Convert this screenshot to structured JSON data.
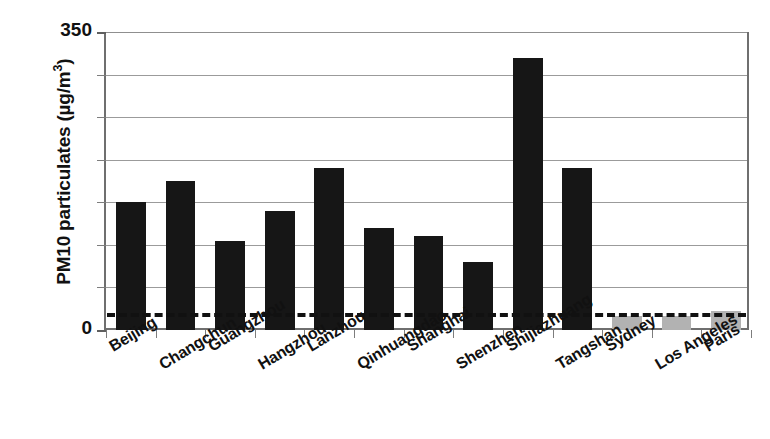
{
  "chart_data": {
    "type": "bar",
    "title": "",
    "subtitle": "",
    "xlabel": "",
    "ylabel": "PM10 particulates (µg/m³)",
    "ylabel_parts": {
      "prefix": "PM10 particulates (µg/m",
      "sup": "3",
      "suffix": ")"
    },
    "ylim": [
      0,
      350
    ],
    "ytick_values": [
      0,
      50,
      100,
      150,
      200,
      250,
      300,
      350
    ],
    "ytick_labels_shown": [
      "350",
      "0"
    ],
    "ymax_label": "350",
    "ymin_label": "0",
    "grid": true,
    "grid_axis": "y",
    "legend": "none",
    "categories": [
      "Beijing",
      "Changchun",
      "Guangzhou",
      "Hangzhou",
      "Lanzhou",
      "Qinhuangdao",
      "Shanghai",
      "Shenzhen",
      "Shijiazhuang",
      "Tangshan",
      "Sydney",
      "Los Angeles",
      "Paris"
    ],
    "values": [
      150,
      175,
      105,
      140,
      190,
      120,
      110,
      80,
      320,
      190,
      17,
      17,
      22
    ],
    "bar_colors": [
      "#161616",
      "#161616",
      "#161616",
      "#161616",
      "#161616",
      "#161616",
      "#161616",
      "#161616",
      "#161616",
      "#161616",
      "#b2b2b2",
      "#b2b2b2",
      "#b2b2b2"
    ],
    "reference_line": {
      "value": 20,
      "style": "dashed",
      "color": "#111111",
      "label": ""
    },
    "colors": {
      "bar_dark": "#161616",
      "bar_light": "#b2b2b2",
      "grid": "#9b9b9b",
      "axis": "#6f6f6f",
      "text": "#111111",
      "background": "#ffffff"
    }
  }
}
